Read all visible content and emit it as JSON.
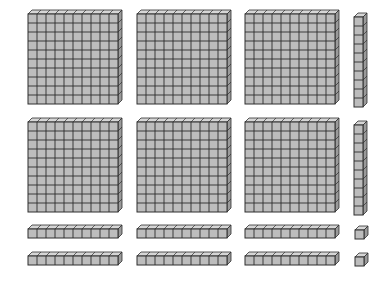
{
  "diagram": {
    "represented_value": 682,
    "counts": {
      "hundreds_flats": 6,
      "tens_rods": 8,
      "ones_units": 2
    },
    "colors": {
      "face": "#bdbdbd",
      "top": "#d6d6d6",
      "side": "#9a9a9a",
      "line": "#2e2e2e",
      "background": "#ffffff"
    },
    "cell_size": 9,
    "depth": 4,
    "blocks": [
      {
        "id": "flat-1",
        "type": "flat",
        "x": 28,
        "y": 14,
        "cols": 10,
        "rows": 10
      },
      {
        "id": "flat-2",
        "type": "flat",
        "x": 137,
        "y": 14,
        "cols": 10,
        "rows": 10
      },
      {
        "id": "flat-3",
        "type": "flat",
        "x": 245,
        "y": 14,
        "cols": 10,
        "rows": 10
      },
      {
        "id": "rod-v-1",
        "type": "rod",
        "x": 354,
        "y": 17,
        "cols": 1,
        "rows": 10
      },
      {
        "id": "flat-4",
        "type": "flat",
        "x": 28,
        "y": 122,
        "cols": 10,
        "rows": 10
      },
      {
        "id": "flat-5",
        "type": "flat",
        "x": 137,
        "y": 122,
        "cols": 10,
        "rows": 10
      },
      {
        "id": "flat-6",
        "type": "flat",
        "x": 245,
        "y": 122,
        "cols": 10,
        "rows": 10
      },
      {
        "id": "rod-v-2",
        "type": "rod",
        "x": 354,
        "y": 125,
        "cols": 1,
        "rows": 10
      },
      {
        "id": "rod-h-1",
        "type": "rod",
        "x": 28,
        "y": 229,
        "cols": 10,
        "rows": 1
      },
      {
        "id": "rod-h-2",
        "type": "rod",
        "x": 137,
        "y": 229,
        "cols": 10,
        "rows": 1
      },
      {
        "id": "rod-h-3",
        "type": "rod",
        "x": 245,
        "y": 229,
        "cols": 10,
        "rows": 1
      },
      {
        "id": "unit-1",
        "type": "unit",
        "x": 355,
        "y": 230,
        "cols": 1,
        "rows": 1
      },
      {
        "id": "rod-h-4",
        "type": "rod",
        "x": 28,
        "y": 256,
        "cols": 10,
        "rows": 1
      },
      {
        "id": "rod-h-5",
        "type": "rod",
        "x": 137,
        "y": 256,
        "cols": 10,
        "rows": 1
      },
      {
        "id": "rod-h-6",
        "type": "rod",
        "x": 245,
        "y": 256,
        "cols": 10,
        "rows": 1
      },
      {
        "id": "unit-2",
        "type": "unit",
        "x": 355,
        "y": 257,
        "cols": 1,
        "rows": 1
      }
    ]
  }
}
